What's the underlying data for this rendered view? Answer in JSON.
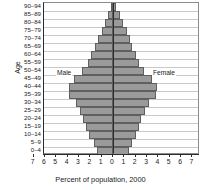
{
  "chart_data": {
    "type": "bar",
    "subtype": "population-pyramid",
    "title": "",
    "xlabel": "Percent of population, 2000",
    "ylabel": "Age",
    "orientation": "horizontal",
    "grid": true,
    "legend_position": "in-plot",
    "xlim": [
      -7,
      7
    ],
    "xtick_labels": [
      "7",
      "6",
      "5",
      "4",
      "3",
      "2",
      "1",
      "0",
      "1",
      "2",
      "3",
      "4",
      "5",
      "6",
      "7"
    ],
    "xtick_values": [
      -7,
      -6,
      -5,
      -4,
      -3,
      -2,
      -1,
      0,
      1,
      2,
      3,
      4,
      5,
      6,
      7
    ],
    "categories": [
      "0–4",
      "5–9",
      "10–14",
      "15–19",
      "20–24",
      "25–29",
      "30–34",
      "35–39",
      "40–44",
      "45–49",
      "50–54",
      "55–59",
      "60–64",
      "65–69",
      "70–74",
      "75–79",
      "80–84",
      "85–89",
      "90–94"
    ],
    "series": [
      {
        "name": "Male",
        "side": "left",
        "values": [
          1.4,
          1.7,
          2.1,
          2.4,
          2.6,
          2.9,
          3.3,
          3.9,
          3.9,
          3.4,
          2.7,
          2.2,
          1.9,
          1.6,
          1.3,
          1.0,
          0.7,
          0.4,
          0.2
        ]
      },
      {
        "name": "Female",
        "side": "right",
        "values": [
          1.4,
          1.7,
          2.0,
          2.3,
          2.5,
          2.8,
          3.2,
          3.8,
          3.9,
          3.4,
          2.7,
          2.3,
          2.0,
          1.7,
          1.5,
          1.2,
          0.9,
          0.6,
          0.3
        ]
      }
    ],
    "colors": {
      "bar_fill": "#9a9a9a",
      "bar_stroke": "#5f5f5f",
      "axis": "#2b2b2b",
      "gridline": "#c9c9c9",
      "text": "#1a1a1a",
      "background": "#ffffff"
    }
  }
}
